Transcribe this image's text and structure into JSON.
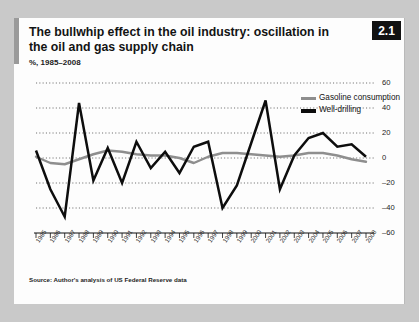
{
  "figure": {
    "badge": "2.1",
    "title": "The bullwhip effect in the oil industry: oscillation in the oil and gas supply chain",
    "subtitle": "%, 1985–2008",
    "source": "Source: Author's analysis of US Federal Reserve data"
  },
  "colors": {
    "card_background": "#fdfdfd",
    "page_background": "#c9c9c9",
    "badge_background": "#111111",
    "badge_text": "#ffffff",
    "accent_bar": "#9a9a9a",
    "gasoline_line": "#8e8e8e",
    "welldrilling_line": "#0d0d0d",
    "gridline": "#4d4d4d",
    "axis": "#111111"
  },
  "chart_data": {
    "type": "line",
    "title": "The bullwhip effect in the oil industry: oscillation in the oil and gas supply chain",
    "subtitle": "%, 1985–2008",
    "xlabel": "",
    "ylabel": "%",
    "ylim": [
      -60,
      60
    ],
    "yticks": [
      60,
      40,
      20,
      0,
      -20,
      -40,
      -60
    ],
    "ytick_labels": [
      "60",
      "40",
      "20",
      "0",
      "–20",
      "–40",
      "–60"
    ],
    "grid": true,
    "legend_position": "top-right",
    "x": [
      1985,
      1986,
      1987,
      1988,
      1989,
      1990,
      1991,
      1992,
      1993,
      1994,
      1995,
      1996,
      1997,
      1998,
      1999,
      2000,
      2001,
      2002,
      2003,
      2004,
      2005,
      2006,
      2007,
      2008
    ],
    "categories": [
      "1985",
      "1986",
      "1987",
      "1988",
      "1989",
      "1990",
      "1991",
      "1992",
      "1993",
      "1994",
      "1995",
      "1996",
      "1997",
      "1998",
      "1999",
      "2000",
      "2001",
      "2002",
      "2003",
      "2004",
      "2005",
      "2006",
      "2007",
      "2008"
    ],
    "series": [
      {
        "name": "Gasoline consumption",
        "color": "#8e8e8e",
        "values": [
          1,
          -4,
          -5,
          -1,
          3,
          6,
          5,
          3,
          2,
          2,
          0,
          -4,
          1,
          4,
          4,
          3,
          2,
          1,
          2,
          4,
          4,
          2,
          -1,
          -3
        ]
      },
      {
        "name": "Well-drilling",
        "color": "#0d0d0d",
        "values": [
          6,
          -25,
          -47,
          44,
          -18,
          8,
          -20,
          13,
          -8,
          5,
          -12,
          9,
          13,
          -40,
          -22,
          12,
          46,
          -25,
          2,
          16,
          20,
          9,
          11,
          1
        ]
      }
    ]
  },
  "legend": {
    "items": [
      {
        "label": "Gasoline consumption",
        "color": "#8e8e8e"
      },
      {
        "label": "Well-drilling",
        "color": "#0d0d0d"
      }
    ]
  }
}
